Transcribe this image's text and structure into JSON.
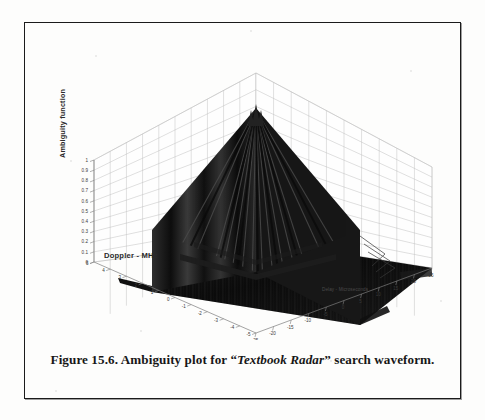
{
  "figure": {
    "caption_prefix": "Figure 15.6. Ambiguity plot for ",
    "caption_quote_open": "“",
    "caption_italic": "Textbook Radar",
    "caption_quote_close": "”",
    "caption_suffix": " search waveform.",
    "caption_full": "Figure 15.6. Ambiguity plot for “Textbook Radar” search waveform.",
    "border_color": "#1b1b1b",
    "page_background": "#fdfdfc"
  },
  "chart_data": {
    "type": "surface",
    "title": "",
    "zlabel": "Ambiguity function",
    "xlabel": "Doppler - MHz",
    "ylabel": "Delay - Microseconds",
    "zlim": [
      0,
      1
    ],
    "zticks": [
      "1",
      "0.9",
      "0.8",
      "0.7",
      "0.6",
      "0.5",
      "0.4",
      "0.3",
      "0.2",
      "0.1",
      "0"
    ],
    "ztick_values": [
      1,
      0.9,
      0.8,
      0.7,
      0.6,
      0.5,
      0.4,
      0.3,
      0.2,
      0.1,
      0
    ],
    "xlim": [
      -5,
      5
    ],
    "xticks": [
      "5",
      "4",
      "3",
      "2",
      "1",
      "0",
      "-1",
      "-2",
      "-3",
      "-4",
      "-5"
    ],
    "xtick_values": [
      5,
      4,
      3,
      2,
      1,
      0,
      -1,
      -2,
      -3,
      -4,
      -5
    ],
    "ylim": [
      -25,
      25
    ],
    "yticks": [
      "-25",
      "-20",
      "-15",
      "-10",
      "-5",
      "0",
      "5",
      "10",
      "15",
      "20",
      "25"
    ],
    "ytick_values": [
      -25,
      -20,
      -15,
      -10,
      -5,
      0,
      5,
      10,
      15,
      20,
      25
    ],
    "grid": true,
    "legend": "none",
    "surface_color": "#141414",
    "grid_color": "#b9b9b9",
    "axis_color": "#8a8a8a",
    "peak": {
      "x": 0,
      "y": 0,
      "z": 1.0
    }
  }
}
